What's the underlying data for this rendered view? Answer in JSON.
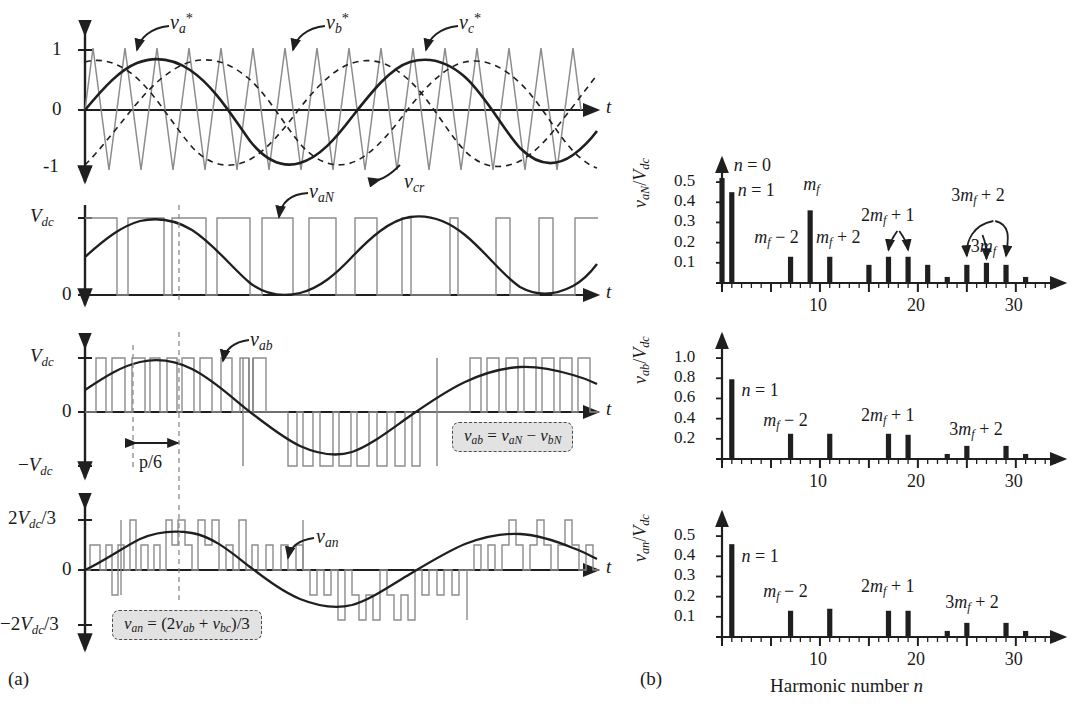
{
  "figure": {
    "panel_a_letter": "(a)",
    "panel_b_letter": "(b)",
    "axis_time_label": "t",
    "harmonic_axis_label": "Harmonic number n"
  },
  "colors": {
    "curve": "#1f1f1f",
    "carrier": "#8c8c8c",
    "switched": "#8c8c8c",
    "axis": "#1f1f1f",
    "bar": "#1f1f1f",
    "callout_bg": "#e2e2e2",
    "callout_border": "#4a4a4a",
    "dashed_guide": "#8c8c8c"
  },
  "panel_a": {
    "plot1": {
      "name": "three-phase-references-and-carrier",
      "y_ticks": [
        "1",
        "0",
        "-1"
      ],
      "annotations": [
        {
          "text": "v*a",
          "html": "<span class='it'>v</span><sub class='it'>a</sub><sup>*</sup>"
        },
        {
          "text": "v*b",
          "html": "<span class='it'>v</span><sub class='it'>b</sub><sup>*</sup>"
        },
        {
          "text": "v*c",
          "html": "<span class='it'>v</span><sub class='it'>c</sub><sup>*</sup>"
        },
        {
          "text": "vcr",
          "html": "<span class='it'>v</span><sub class='it'>cr</sub>"
        }
      ],
      "carrier_ratio": 15,
      "modulation_index": 0.8
    },
    "plot2": {
      "name": "pole-voltage-vaN",
      "y_ticks": [
        "Vdc",
        "0"
      ],
      "signal_label": "vaN",
      "levels": [
        0,
        1
      ]
    },
    "plot3": {
      "name": "line-voltage-vab",
      "y_ticks": [
        "Vdc",
        "0",
        "-Vdc"
      ],
      "signal_label": "vab",
      "width_marker": "p/6",
      "callout": "vab = vaN - vbN",
      "levels": [
        -1,
        0,
        1
      ]
    },
    "plot4": {
      "name": "phase-voltage-van",
      "y_ticks": [
        "2Vdc/3",
        "0",
        "-2Vdc/3"
      ],
      "signal_label": "van",
      "callout": "van = (2vab + vbc)/3",
      "levels": [
        -0.667,
        -0.333,
        0,
        0.333,
        0.667
      ]
    }
  },
  "chart_data": [
    {
      "name": "spectrum-vaN",
      "type": "bar",
      "title": "",
      "ylabel": "vaN/Vdc",
      "xlabel": "Harmonic number n",
      "ylim": [
        0,
        0.55
      ],
      "y_ticks": [
        "0.1",
        "0.2",
        "0.3",
        "0.4",
        "0.5"
      ],
      "y_tick_values": [
        0.1,
        0.2,
        0.3,
        0.4,
        0.5
      ],
      "xlim": [
        0,
        34
      ],
      "x_ticks": [
        10,
        20,
        30
      ],
      "x_tick_labels": [
        "10",
        "20",
        "30"
      ],
      "minor_tick_step": 1,
      "major_tick_step": 5,
      "categories": [
        0,
        1,
        7,
        9,
        11,
        15,
        17,
        19,
        21,
        23,
        25,
        27,
        29,
        31
      ],
      "values": [
        0.52,
        0.45,
        0.13,
        0.36,
        0.13,
        0.09,
        0.13,
        0.13,
        0.09,
        0.03,
        0.09,
        0.1,
        0.09,
        0.03
      ],
      "annotations": [
        {
          "label": "n = 0",
          "at": 0
        },
        {
          "label": "n = 1",
          "at": 1
        },
        {
          "label": "mf - 2",
          "at": 7
        },
        {
          "label": "mf",
          "at": 9
        },
        {
          "label": "mf + 2",
          "at": 11
        },
        {
          "label": "2mf + 1",
          "at": 18
        },
        {
          "label": "3mf + 2",
          "at": 28
        },
        {
          "label": "3mf",
          "at": 27
        }
      ]
    },
    {
      "name": "spectrum-vab",
      "type": "bar",
      "title": "",
      "ylabel": "vab/Vdc",
      "xlabel": "Harmonic number n",
      "ylim": [
        0,
        1.1
      ],
      "y_ticks": [
        "0.2",
        "0.4",
        "0.6",
        "0.8",
        "1.0"
      ],
      "y_tick_values": [
        0.2,
        0.4,
        0.6,
        0.8,
        1.0
      ],
      "xlim": [
        0,
        34
      ],
      "x_ticks": [
        10,
        20,
        30
      ],
      "x_tick_labels": [
        "10",
        "20",
        "30"
      ],
      "minor_tick_step": 1,
      "major_tick_step": 5,
      "categories": [
        1,
        7,
        11,
        17,
        19,
        23,
        25,
        29,
        31
      ],
      "values": [
        0.79,
        0.25,
        0.25,
        0.25,
        0.24,
        0.05,
        0.13,
        0.13,
        0.05
      ],
      "annotations": [
        {
          "label": "n = 1",
          "at": 1
        },
        {
          "label": "mf - 2",
          "at": 7
        },
        {
          "label": "2mf + 1",
          "at": 18
        },
        {
          "label": "3mf + 2",
          "at": 29
        }
      ]
    },
    {
      "name": "spectrum-van",
      "type": "bar",
      "title": "",
      "ylabel": "van/Vdc",
      "xlabel": "Harmonic number n",
      "ylim": [
        0,
        0.55
      ],
      "y_ticks": [
        "0.1",
        "0.2",
        "0.3",
        "0.4",
        "0.5"
      ],
      "y_tick_values": [
        0.1,
        0.2,
        0.3,
        0.4,
        0.5
      ],
      "xlim": [
        0,
        34
      ],
      "x_ticks": [
        10,
        20,
        30
      ],
      "x_tick_labels": [
        "10",
        "20",
        "30"
      ],
      "minor_tick_step": 1,
      "major_tick_step": 5,
      "categories": [
        1,
        7,
        11,
        17,
        19,
        23,
        25,
        29,
        31
      ],
      "values": [
        0.46,
        0.13,
        0.14,
        0.13,
        0.13,
        0.03,
        0.07,
        0.07,
        0.03
      ],
      "annotations": [
        {
          "label": "n = 1",
          "at": 1
        },
        {
          "label": "mf - 2",
          "at": 7
        },
        {
          "label": "2mf + 1",
          "at": 18
        },
        {
          "label": "3mf + 2",
          "at": 29
        }
      ]
    }
  ]
}
